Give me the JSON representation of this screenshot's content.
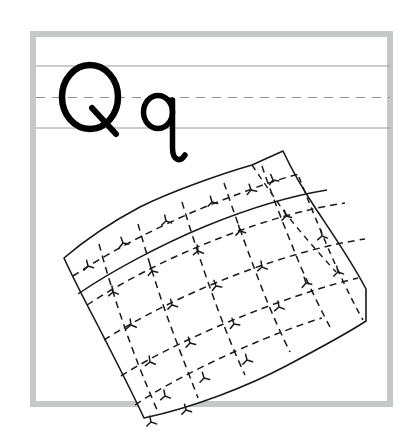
{
  "worksheet": {
    "type": "handwriting-practice-worksheet",
    "title": "Letter Q q handwriting practice with quilt illustration",
    "letters": {
      "uppercase": "Q",
      "lowercase": "q"
    },
    "illustration": {
      "name": "quilt",
      "label": "quilt",
      "description": "A patchwork quilt drawn in perspective with dashed stitching lines forming a grid of square patches, each patch containing a small three-pronged stitch mark."
    },
    "frame": {
      "color": "#c6c8c8",
      "thickness": 6,
      "x": 30,
      "y": 31,
      "width": 363,
      "height": 376
    },
    "guidelines": {
      "top_solid_y": 66,
      "mid_dashed_y": 97,
      "bottom_solid_y": 128,
      "solid_color": "#9a9a9a",
      "dashed_color": "#8d8d8d",
      "dash_pattern": "9 7"
    },
    "ink_color": "#000000",
    "background_color": "#ffffff",
    "quilt_geometry": {
      "outline": "M64,258 L88,236 L140,206 L196,182 L242,168 L283,151 L300,180 L330,224 L352,258 L365,290 L366,320 L352,335 L318,352 L272,378 L218,402 L144,418 L118,369 L96,327 L78,294 Z",
      "columns": 6,
      "rows": 6,
      "stitch_mark_count": 24
    }
  }
}
